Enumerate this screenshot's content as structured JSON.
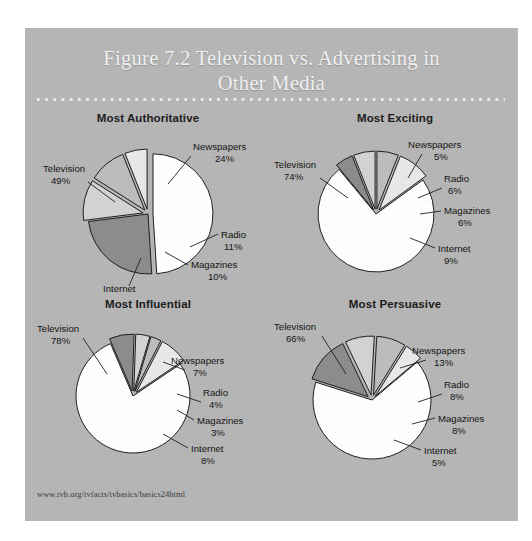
{
  "figure": {
    "title": "Figure 7.2 Television vs. Advertising in Other Media",
    "title_line1": "Figure 7.2 Television vs. Advertising in",
    "title_line2": "Other Media",
    "source_url": "www.tvb.org/tvfacts/tvbasics/basics24html",
    "background_color": "#b6b6b6",
    "title_color": "#f2f2f2"
  },
  "palette": {
    "television": "#ffffff",
    "newspapers": "#8c8c8c",
    "radio": "#d3d3d3",
    "magazines": "#bdbdbd",
    "internet": "#e9e9e9",
    "outline": "#1e1e1e"
  },
  "chart_data": [
    {
      "type": "pie",
      "title": "Most Authoritative",
      "labels": [
        "Television",
        "Newspapers",
        "Radio",
        "Magazines",
        "Internet"
      ],
      "values": [
        49,
        24,
        11,
        10,
        6
      ],
      "value_labels": [
        "49%",
        "24%",
        "11%",
        "10%",
        "6%"
      ],
      "colors": [
        "#ffffff",
        "#8c8c8c",
        "#d3d3d3",
        "#bdbdbd",
        "#e9e9e9"
      ],
      "exploded": [
        true,
        false,
        true,
        true,
        true
      ],
      "legend_position": "callout-labels",
      "grid": false
    },
    {
      "type": "pie",
      "title": "Most Exciting",
      "labels": [
        "Television",
        "Newspapers",
        "Radio",
        "Magazines",
        "Internet"
      ],
      "values": [
        74,
        5,
        6,
        6,
        9
      ],
      "value_labels": [
        "74%",
        "5%",
        "6%",
        "6%",
        "9%"
      ],
      "colors": [
        "#ffffff",
        "#8c8c8c",
        "#d3d3d3",
        "#bdbdbd",
        "#e9e9e9"
      ],
      "exploded": [
        false,
        true,
        true,
        true,
        true
      ],
      "legend_position": "callout-labels",
      "grid": false
    },
    {
      "type": "pie",
      "title": "Most Influential",
      "labels": [
        "Television",
        "Newspapers",
        "Radio",
        "Magazines",
        "Internet"
      ],
      "values": [
        78,
        7,
        4,
        3,
        8
      ],
      "value_labels": [
        "78%",
        "7%",
        "4%",
        "3%",
        "8%"
      ],
      "colors": [
        "#ffffff",
        "#8c8c8c",
        "#d3d3d3",
        "#bdbdbd",
        "#e9e9e9"
      ],
      "exploded": [
        false,
        true,
        true,
        true,
        true
      ],
      "legend_position": "callout-labels",
      "grid": false
    },
    {
      "type": "pie",
      "title": "Most Persuasive",
      "labels": [
        "Television",
        "Newspapers",
        "Radio",
        "Magazines",
        "Internet"
      ],
      "values": [
        66,
        13,
        8,
        8,
        5
      ],
      "value_labels": [
        "66%",
        "13%",
        "8%",
        "8%",
        "5%"
      ],
      "colors": [
        "#ffffff",
        "#8c8c8c",
        "#d3d3d3",
        "#bdbdbd",
        "#e9e9e9"
      ],
      "exploded": [
        false,
        true,
        true,
        true,
        true
      ],
      "legend_position": "callout-labels",
      "grid": false
    }
  ],
  "layout": {
    "charts": [
      {
        "cx": 123,
        "cy": 88,
        "r": 60,
        "start_angle": -90,
        "explode_dist": 5,
        "labels": [
          {
            "name": "Television",
            "tx": 18,
            "ty": 46,
            "vx": 26,
            "vy": 58,
            "anchor": "start",
            "leader": [
              [
                63,
                56
              ],
              [
                90,
                76
              ]
            ]
          },
          {
            "name": "Newspapers",
            "tx": 168,
            "ty": 24,
            "vx": 190,
            "vy": 36,
            "anchor": "start",
            "leader": [
              [
                166,
                30
              ],
              [
                143,
                58
              ]
            ]
          },
          {
            "name": "Radio",
            "tx": 196,
            "ty": 112,
            "vx": 199,
            "vy": 124,
            "anchor": "start",
            "leader": [
              [
                193,
                108
              ],
              [
                165,
                121
              ]
            ]
          },
          {
            "name": "Magazines",
            "tx": 166,
            "ty": 142,
            "vx": 183,
            "vy": 154,
            "anchor": "start",
            "leader": [
              [
                163,
                139
              ],
              [
                140,
                126
              ]
            ]
          },
          {
            "name": "Internet",
            "tx": 78,
            "ty": 166,
            "vx": 90,
            "vy": 178,
            "anchor": "start",
            "leader": [
              [
                104,
                160
              ],
              [
                116,
                132
              ]
            ]
          }
        ]
      },
      {
        "cx": 104,
        "cy": 88,
        "r": 58,
        "start_angle": -36,
        "explode_dist": 5,
        "labels": [
          {
            "name": "Television",
            "tx": 2,
            "ty": 42,
            "vx": 12,
            "vy": 54,
            "anchor": "start",
            "leader": [
              [
                48,
                52
              ],
              [
                76,
                72
              ]
            ]
          },
          {
            "name": "Newspapers",
            "tx": 136,
            "ty": 22,
            "vx": 162,
            "vy": 34,
            "anchor": "start",
            "leader": [
              [
                150,
                28
              ],
              [
                136,
                52
              ]
            ]
          },
          {
            "name": "Radio",
            "tx": 172,
            "ty": 56,
            "vx": 176,
            "vy": 68,
            "anchor": "start",
            "leader": [
              [
                170,
                62
              ],
              [
                146,
                72
              ]
            ]
          },
          {
            "name": "Magazines",
            "tx": 172,
            "ty": 88,
            "vx": 186,
            "vy": 100,
            "anchor": "start",
            "leader": [
              [
                169,
                85
              ],
              [
                148,
                88
              ]
            ]
          },
          {
            "name": "Internet",
            "tx": 166,
            "ty": 126,
            "vx": 172,
            "vy": 138,
            "anchor": "start",
            "leader": [
              [
                163,
                122
              ],
              [
                138,
                112
              ]
            ]
          }
        ]
      },
      {
        "cx": 108,
        "cy": 84,
        "r": 57,
        "start_angle": -34,
        "explode_dist": 5,
        "labels": [
          {
            "name": "Television",
            "tx": 12,
            "ty": 20,
            "vx": 26,
            "vy": 32,
            "anchor": "start",
            "leader": [
              [
                58,
                26
              ],
              [
                82,
                62
              ]
            ]
          },
          {
            "name": "Newspapers",
            "tx": 146,
            "ty": 52,
            "vx": 168,
            "vy": 64,
            "anchor": "start",
            "leader": [
              [
                160,
                58
              ],
              [
                138,
                50
              ]
            ]
          },
          {
            "name": "Radio",
            "tx": 178,
            "ty": 84,
            "vx": 184,
            "vy": 96,
            "anchor": "start",
            "leader": [
              [
                176,
                90
              ],
              [
                152,
                82
              ]
            ]
          },
          {
            "name": "Magazines",
            "tx": 172,
            "ty": 112,
            "vx": 186,
            "vy": 124,
            "anchor": "start",
            "leader": [
              [
                169,
                108
              ],
              [
                152,
                98
              ]
            ]
          },
          {
            "name": "Internet",
            "tx": 166,
            "ty": 140,
            "vx": 176,
            "vy": 152,
            "anchor": "start",
            "leader": [
              [
                163,
                136
              ],
              [
                138,
                122
              ]
            ]
          }
        ]
      },
      {
        "cx": 100,
        "cy": 88,
        "r": 59,
        "start_angle": -40,
        "explode_dist": 5,
        "labels": [
          {
            "name": "Television",
            "tx": 2,
            "ty": 18,
            "vx": 14,
            "vy": 30,
            "anchor": "start",
            "leader": [
              [
                50,
                24
              ],
              [
                74,
                62
              ]
            ]
          },
          {
            "name": "Newspapers",
            "tx": 140,
            "ty": 42,
            "vx": 162,
            "vy": 54,
            "anchor": "start",
            "leader": [
              [
                154,
                48
              ],
              [
                128,
                56
              ]
            ]
          },
          {
            "name": "Radio",
            "tx": 172,
            "ty": 76,
            "vx": 178,
            "vy": 88,
            "anchor": "start",
            "leader": [
              [
                170,
                82
              ],
              [
                146,
                90
              ]
            ]
          },
          {
            "name": "Magazines",
            "tx": 166,
            "ty": 110,
            "vx": 180,
            "vy": 122,
            "anchor": "start",
            "leader": [
              [
                163,
                106
              ],
              [
                140,
                112
              ]
            ]
          },
          {
            "name": "Internet",
            "tx": 152,
            "ty": 142,
            "vx": 160,
            "vy": 154,
            "anchor": "start",
            "leader": [
              [
                149,
                138
              ],
              [
                122,
                128
              ]
            ]
          }
        ]
      }
    ]
  }
}
